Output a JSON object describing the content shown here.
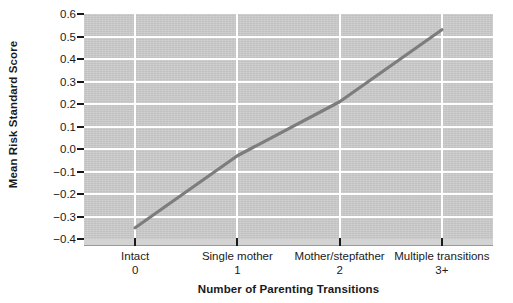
{
  "chart_data": {
    "type": "line",
    "title": "",
    "xlabel": "Number of Parenting Transitions",
    "ylabel": "Mean Risk Standard Score",
    "categories": [
      "Intact",
      "Single mother",
      "Mother/stepfather",
      "Multiple transitions"
    ],
    "category_values": [
      "0",
      "1",
      "2",
      "3+"
    ],
    "x": [
      0,
      1,
      2,
      3
    ],
    "values": [
      -0.35,
      -0.03,
      0.21,
      0.53
    ],
    "series": [
      {
        "name": "Mean Risk Standard Score",
        "values": [
          -0.35,
          -0.03,
          0.21,
          0.53
        ]
      }
    ],
    "ylim": [
      -0.4,
      0.6
    ],
    "ytick_labels": [
      "0.6",
      "0.5",
      "0.4",
      "0.3",
      "0.2",
      "0.1",
      "0.0",
      "−0.1",
      "−0.2",
      "−0.3",
      "−0.4"
    ],
    "ytick_values": [
      0.6,
      0.5,
      0.4,
      0.3,
      0.2,
      0.1,
      0.0,
      -0.1,
      -0.2,
      -0.3,
      -0.4
    ],
    "grid": "horizontal-and-category-verticals",
    "legend": "none",
    "colors": {
      "line": "#7d7d7d",
      "plot_background": "#c8c8c8",
      "gridline": "#ffffff",
      "text": "#1a1a1a",
      "page_background": "#ffffff"
    }
  }
}
